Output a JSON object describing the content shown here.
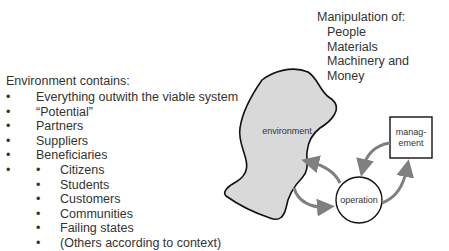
{
  "left_panel": {
    "heading": "Environment contains:",
    "items": [
      "Everything outwith the viable system",
      "“Potential”",
      "Partners",
      "Suppliers",
      "Beneficiaries"
    ],
    "sub_items": [
      "Citizens",
      "Students",
      "Customers",
      "Communities",
      "Failing states",
      "(Others according to context)"
    ]
  },
  "manipulation": {
    "heading": "Manipulation of:",
    "items": [
      "People",
      "Materials",
      "Machinery and",
      "Money"
    ]
  },
  "diagram": {
    "environment_label": "environment",
    "operation_label": "operation",
    "management_label_1": "manag-",
    "management_label_2": "ement",
    "colors": {
      "blob_fill": "#d9d9d9",
      "outline": "#111111",
      "arrow": "#808080"
    }
  }
}
